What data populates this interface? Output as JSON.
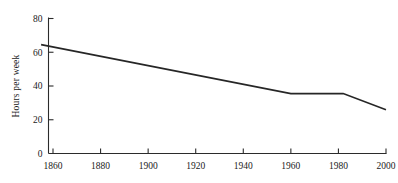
{
  "chart_data": {
    "type": "line",
    "title": "",
    "subtitle": "",
    "xlabel": "",
    "ylabel": "Hours per week",
    "xlim": [
      1855,
      2000
    ],
    "ylim": [
      0,
      85
    ],
    "grid": false,
    "legend": false,
    "legend_position": "none",
    "line_color": "#262626",
    "axis_color": "#2b2b2b",
    "background_color": "#ffffff",
    "xticks": [
      1860,
      1880,
      1900,
      1920,
      1940,
      1960,
      1980,
      2000
    ],
    "xtick_labels": [
      "1860",
      "1880",
      "1900",
      "1920",
      "1940",
      "1960",
      "1980",
      "2000"
    ],
    "yticks": [
      0,
      20,
      40,
      60,
      80
    ],
    "ytick_labels": [
      "0",
      "20",
      "40",
      "60",
      "80"
    ],
    "series": [
      {
        "name": "Hours per week",
        "x": [
          1855,
          1960,
          1982,
          2000
        ],
        "values": [
          64.5,
          35.5,
          35.5,
          26.0
        ]
      }
    ],
    "annotations": []
  }
}
